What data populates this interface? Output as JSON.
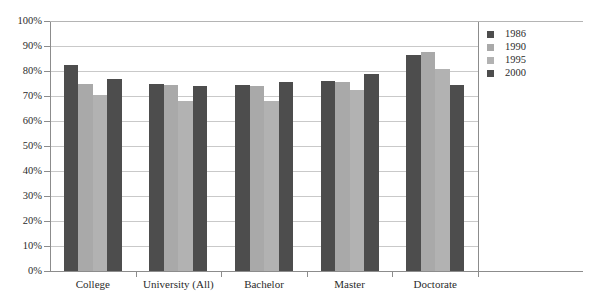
{
  "chart_data": {
    "type": "bar",
    "title": "",
    "xlabel": "",
    "ylabel": "",
    "ylim": [
      0,
      100
    ],
    "grid": true,
    "legend_position": "right",
    "categories": [
      "College",
      "University (All)",
      "Bachelor",
      "Master",
      "Doctorate"
    ],
    "ytick_labels": [
      "100%",
      "90%",
      "80%",
      "70%",
      "60%",
      "50%",
      "40%",
      "30%",
      "20%",
      "10%",
      "0%"
    ],
    "ytick_values": [
      100,
      90,
      80,
      70,
      60,
      50,
      40,
      30,
      20,
      10,
      0
    ],
    "series": [
      {
        "name": "1986",
        "color": "#4d4d4d",
        "values": [
          82.5,
          75.0,
          74.5,
          76.0,
          86.5
        ]
      },
      {
        "name": "1990",
        "color": "#a9a9a9",
        "values": [
          75.0,
          74.5,
          74.0,
          75.5,
          87.5
        ]
      },
      {
        "name": "1995",
        "color": "#b2b2b2",
        "values": [
          70.5,
          68.0,
          68.0,
          72.5,
          81.0
        ]
      },
      {
        "name": "2000",
        "color": "#4d4d4d",
        "values": [
          77.0,
          74.0,
          75.5,
          79.0,
          74.5
        ]
      }
    ]
  },
  "legend": {
    "items": [
      {
        "label": "1986"
      },
      {
        "label": "1990"
      },
      {
        "label": "1995"
      },
      {
        "label": "2000"
      }
    ]
  },
  "colors": {
    "series_1986": "#4d4d4d",
    "series_1990": "#a9a9a9",
    "series_1995": "#b2b2b2",
    "series_2000": "#4d4d4d",
    "gridline": "#c9c9c9",
    "axis": "#8c8c8c",
    "text": "#2b2b2b",
    "background": "#ffffff"
  }
}
